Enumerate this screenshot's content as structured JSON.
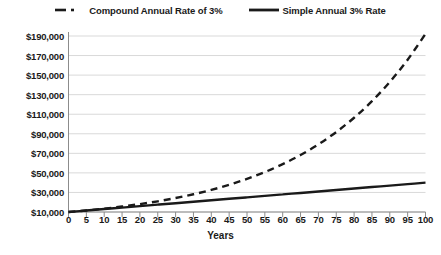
{
  "chart_data": {
    "type": "line",
    "title": "",
    "subtitle": "",
    "xlabel": "Years",
    "ylabel": "",
    "grid": true,
    "legend_position": "top",
    "xlim": [
      0,
      100
    ],
    "ylim": [
      10000,
      190000
    ],
    "x_ticks": [
      0,
      5,
      10,
      15,
      20,
      25,
      30,
      35,
      40,
      45,
      50,
      55,
      60,
      65,
      70,
      75,
      80,
      85,
      90,
      95,
      100
    ],
    "x_tick_labels": [
      "0",
      "5",
      "10",
      "15",
      "20",
      "25",
      "30",
      "35",
      "40",
      "45",
      "50",
      "55",
      "60",
      "65",
      "70",
      "75",
      "80",
      "85",
      "90",
      "95",
      "100"
    ],
    "y_ticks": [
      10000,
      30000,
      50000,
      70000,
      90000,
      110000,
      130000,
      150000,
      170000,
      190000
    ],
    "y_tick_labels": [
      "$10,000",
      "$30,000",
      "$50,000",
      "$70,000",
      "$90,000",
      "$110,000",
      "$130,000",
      "$150,000",
      "$170,000",
      "$190,000"
    ],
    "series": [
      {
        "name": "Compound Annual Rate of 3%",
        "style": "dashed",
        "color": "#1a1a1a",
        "x": [
          0,
          5,
          10,
          15,
          20,
          25,
          30,
          35,
          40,
          45,
          50,
          55,
          60,
          65,
          70,
          75,
          80,
          85,
          90,
          95,
          100
        ],
        "values": [
          10000,
          11593,
          13439,
          15580,
          18061,
          20938,
          24273,
          28139,
          32620,
          37816,
          43839,
          50821,
          58916,
          68300,
          79178,
          91786,
          106409,
          123361,
          143013,
          165794,
          192186
        ]
      },
      {
        "name": "Simple Annual 3% Rate",
        "style": "solid",
        "color": "#1a1a1a",
        "x": [
          0,
          5,
          10,
          15,
          20,
          25,
          30,
          35,
          40,
          45,
          50,
          55,
          60,
          65,
          70,
          75,
          80,
          85,
          90,
          95,
          100
        ],
        "values": [
          10000,
          11500,
          13000,
          14500,
          16000,
          17500,
          19000,
          20500,
          22000,
          23500,
          25000,
          26500,
          28000,
          29500,
          31000,
          32500,
          34000,
          35500,
          37000,
          38500,
          40000
        ]
      }
    ]
  },
  "legend": {
    "entries": [
      {
        "label": "Compound Annual Rate of 3%",
        "marker": "dashed-line-marker"
      },
      {
        "label": "Simple Annual 3% Rate",
        "marker": "solid-line-marker"
      }
    ]
  },
  "axis": {
    "x_title": "Years"
  },
  "colors": {
    "series_line": "#1a1a1a",
    "grid": "#d9d9d9",
    "axis": "#8c8c8c",
    "background": "#ffffff"
  }
}
